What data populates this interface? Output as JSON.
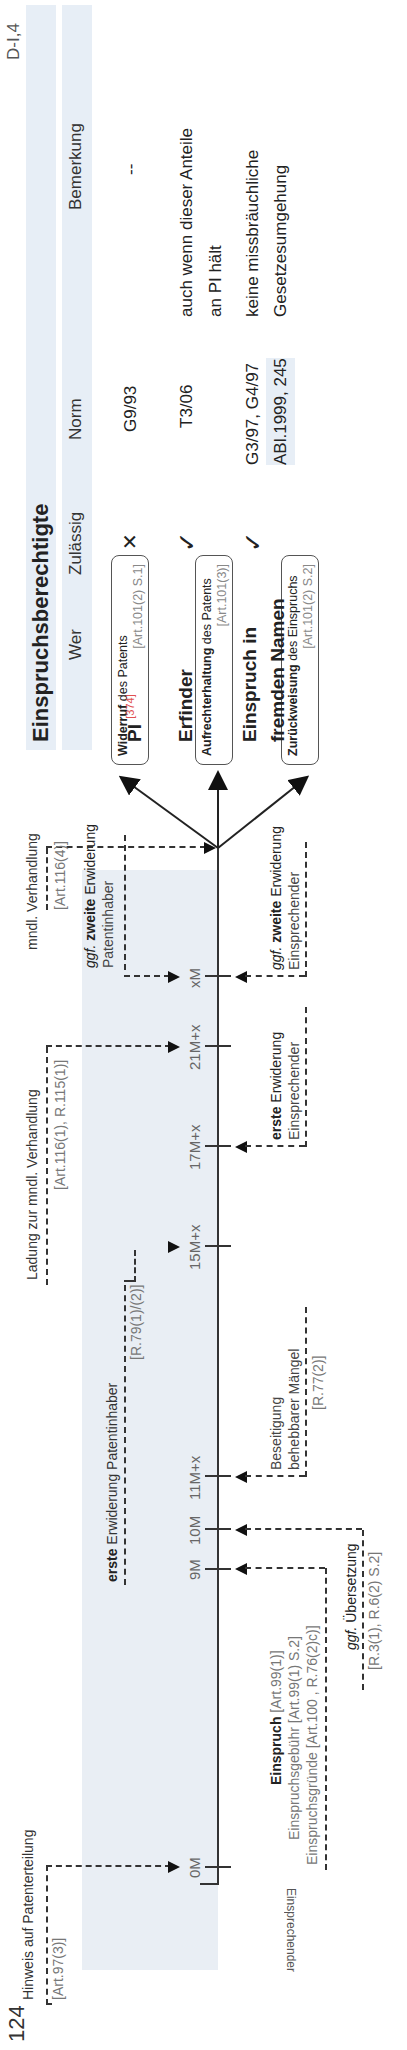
{
  "page": {
    "number": "124",
    "section_ref": "D-I,4",
    "orientation": "rotated 90° counter-clockwise"
  },
  "diagram": {
    "lanes": {
      "top_label": "Patentinhaber",
      "bottom_label": "Einsprechender"
    },
    "timeline_ticks": [
      {
        "label": "0M"
      },
      {
        "label": "9M"
      },
      {
        "label": "10M"
      },
      {
        "label": "11M+x"
      },
      {
        "label": "15M+x"
      },
      {
        "label": "17M+x"
      },
      {
        "label": "21M+x"
      },
      {
        "label": "xM"
      }
    ],
    "patentinhaber_events": {
      "hinweis": {
        "title": "Hinweis auf Patenterteilung",
        "ref": "[Art.97(3)]"
      },
      "erste_erwiderung": {
        "bold": "erste",
        "rest": " Erwiderung Patentinhaber",
        "ref": "[R.79(1)/(2)]"
      },
      "ladung": {
        "title": "Ladung zur mndl. Verhandlung",
        "ref": "[Art.116(1), R.115(1)]"
      },
      "zweite_erwiderung": {
        "prefix": "ggf.",
        "bold": "zweite",
        "rest": " Erwiderung",
        "line2": "Patentinhaber"
      },
      "verhandlung": {
        "title": "mndl. Verhandlung",
        "ref": "[Art.116(4)]"
      }
    },
    "einsprechender_events": {
      "einspruch": {
        "bold": "Einspruch",
        "ref1": " [Art.99(1)]",
        "line2": "Einspruchsgebühr [Art.99(1) S.2]",
        "line3": "Einspruchsgründe [Art.100 , R.76(2)c)]"
      },
      "uebersetzung": {
        "prefix": "ggf.",
        "rest": " Übersetzung",
        "ref": "[R.3(1), R.6(2) S.2]"
      },
      "beseitigung": {
        "line1": "Beseitigung",
        "line2": "behebbarer Mängel",
        "ref": "[R.77(2)]"
      },
      "erste_erwiderung": {
        "bold": "erste",
        "rest": " Erwiderung",
        "line2": "Einsprechender"
      },
      "zweite_erwiderung": {
        "prefix": "ggf.",
        "bold": "zweite",
        "rest": " Erwiderung",
        "line2": "Einsprechender"
      }
    },
    "outcomes": [
      {
        "bold": "Widerruf",
        "rest": " des Patents",
        "ref": "[Art.101(2) S.1]"
      },
      {
        "bold": "Aufrechterhaltung",
        "rest": " des Patents",
        "ref": "[Art.101(3)]"
      },
      {
        "bold": "Zurückweisung",
        "rest": " des Einspruchs",
        "ref": "[Art.101(2) S.2]"
      }
    ]
  },
  "table": {
    "title": "Einspruchsberechtigte",
    "headers": [
      "Wer",
      "Zulässig",
      "Norm",
      "Bemerkung"
    ],
    "rows": [
      {
        "wer": "PI",
        "wer_ref": "[374]",
        "zulaessig": "✕",
        "norm": "G9/93",
        "bemerkung": "--"
      },
      {
        "wer": "Erfinder",
        "zulaessig": "✓",
        "norm": "T3/06",
        "bemerkung": "auch wenn dieser Anteile",
        "bemerkung2": "an PI hält"
      },
      {
        "wer": "Einspruch in",
        "wer2": "fremden Namen",
        "zulaessig": "✓",
        "norm": "G3/97, G4/97",
        "norm2": "ABl.1999, 245",
        "bemerkung": "keine missbräuchliche",
        "bemerkung2": "Gesetzesumgehung"
      }
    ]
  },
  "colors": {
    "shade": "#e9eef4",
    "ref_red": "#e05050",
    "line": "#333333"
  }
}
